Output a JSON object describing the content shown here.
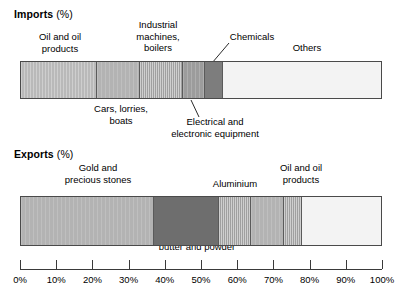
{
  "chart_data": {
    "type": "bar",
    "title": "",
    "orientation": "horizontal-stacked",
    "xlabel": "",
    "ylabel": "",
    "xlim": [
      0,
      100
    ],
    "grid": false,
    "legend_position": "none",
    "axis": {
      "tick_labels": [
        "0%",
        "10%",
        "20%",
        "30%",
        "40%",
        "50%",
        "60%",
        "70%",
        "80%",
        "90%",
        "100%"
      ],
      "tick_values": [
        0,
        10,
        20,
        30,
        40,
        50,
        60,
        70,
        80,
        90,
        100
      ]
    },
    "charts": [
      {
        "name": "imports",
        "title_main": "Imports",
        "title_unit": "(%)",
        "categories": [
          "Oil and oil products",
          "Cars, lorries, boats",
          "Industrial machines, boilers",
          "Electrical and electronic equipment",
          "Chemicals",
          "Others"
        ],
        "values": [
          21,
          12,
          12,
          6,
          5,
          44
        ],
        "starts": [
          0,
          21,
          33,
          45,
          51,
          56
        ],
        "ends": [
          21,
          33,
          45,
          51,
          56,
          100
        ]
      },
      {
        "name": "exports",
        "title_main": "Exports",
        "title_unit": "(%)",
        "categories": [
          "Gold and precious stones",
          "Cocoa beans, cocoa butter and powder",
          "Aluminium",
          "Timber",
          "Oil and oil products",
          "Others"
        ],
        "values": [
          37,
          18,
          9,
          9,
          5,
          22
        ],
        "starts": [
          0,
          37,
          55,
          64,
          73,
          78
        ],
        "ends": [
          37,
          55,
          64,
          73,
          78,
          100
        ]
      }
    ]
  },
  "imports": {
    "title_main": "Imports",
    "title_unit": "(%)",
    "labels": {
      "oil": "Oil and oil\nproducts",
      "cars": "Cars, lorries,\nboats",
      "industrial": "Industrial\nmachines,\nboilers",
      "electrical": "Electrical and\nelectronic equipment",
      "chemicals": "Chemicals",
      "others": "Others"
    }
  },
  "exports": {
    "title_main": "Exports",
    "title_unit": "(%)",
    "labels": {
      "gold": "Gold and\nprecious stones",
      "cocoa": "Cocoa beans, cocoa\nbutter and powder",
      "aluminium": "Aluminium",
      "timber": "Timber",
      "oil": "Oil and oil\nproducts",
      "others": "Others"
    }
  },
  "colors": {
    "oil_import": "#b9b9b9",
    "cars": "#b3b3b3",
    "industrial": "#a8a8a8",
    "electrical": "#9c9c9c",
    "chemicals": "#7d7d7d",
    "others": "#f3f3f3",
    "gold": "#b3b3b3",
    "cocoa": "#6e6e6e",
    "aluminium": "#a8a8a8",
    "timber": "#b3b3b3",
    "oil_export": "#a8a8a8",
    "border": "#4a4a4a",
    "text": "#000000"
  }
}
